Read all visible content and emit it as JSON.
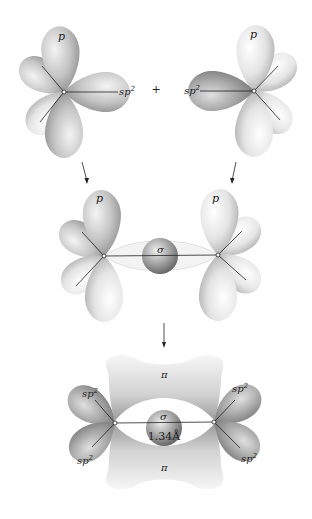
{
  "diagram": {
    "stage1": {
      "left_atom": {
        "p_label": "p",
        "sp2_label": "sp",
        "sp2_sup": "2"
      },
      "plus": "+",
      "right_atom": {
        "p_label": "p",
        "sp2_label": "sp",
        "sp2_sup": "2"
      }
    },
    "stage2": {
      "left_p_label": "p",
      "right_p_label": "p",
      "sigma_label": "σ"
    },
    "stage3": {
      "pi_top_label": "π",
      "pi_bottom_label": "π",
      "sigma_label": "σ",
      "bond_length": "1.34Å",
      "sp2_labels": [
        {
          "base": "sp",
          "sup": "2",
          "position": "upper-left"
        },
        {
          "base": "sp",
          "sup": "2",
          "position": "upper-right"
        },
        {
          "base": "sp",
          "sup": "2",
          "position": "lower-left"
        },
        {
          "base": "sp",
          "sup": "2",
          "position": "lower-right"
        }
      ]
    },
    "colors": {
      "lobe_light": "#f2f2f2",
      "lobe_mid": "#c8c8c8",
      "lobe_dark": "#8c8c8c",
      "line": "#222222",
      "background": "#ffffff"
    }
  }
}
